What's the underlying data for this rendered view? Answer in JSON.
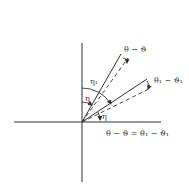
{
  "diagram": {
    "type": "angle-geometry",
    "colors": {
      "line": "#333333",
      "background": "#ffffff"
    },
    "axes": {
      "horizontal": "x-axis",
      "vertical": "y-axis"
    },
    "labels": {
      "upper_angle": "θ − ϑ",
      "lower_angle": "θ₁ − ϑ₁",
      "eta1": "η₁",
      "eta_upper": "η",
      "eta_lower": "η",
      "equation": "θ − ϑ = θ₁ − ϑ₁"
    },
    "lines": [
      {
        "name": "upper-solid-ray",
        "style": "solid"
      },
      {
        "name": "upper-dashed-ray",
        "style": "dashed"
      },
      {
        "name": "lower-solid-ray",
        "style": "solid"
      },
      {
        "name": "lower-dashed-ray",
        "style": "dashed"
      }
    ]
  }
}
